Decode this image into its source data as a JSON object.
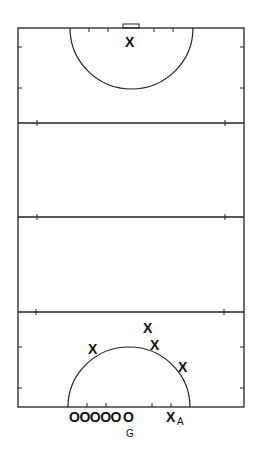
{
  "diagram": {
    "type": "netball-court",
    "line_color": "#222222",
    "background": "#ffffff",
    "top_half": {
      "players": [
        {
          "symbol": "X",
          "x": 131,
          "y": 45
        }
      ]
    },
    "bottom_half": {
      "attackers": [
        {
          "symbol": "X",
          "x": 94,
          "y": 352
        },
        {
          "symbol": "X",
          "x": 148,
          "y": 331
        },
        {
          "symbol": "X",
          "x": 156,
          "y": 348
        },
        {
          "symbol": "X",
          "x": 183,
          "y": 370
        }
      ],
      "baseline_defenders": "OOOOO",
      "goalkeeper_symbol": "O",
      "goalkeeper_label": "G",
      "attacker_A_symbol": "X",
      "attacker_A_label": "A"
    }
  }
}
